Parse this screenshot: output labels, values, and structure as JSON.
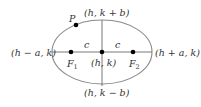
{
  "diagram": {
    "type": "ellipse-foci",
    "colors": {
      "ellipse_stroke": "#8a8a8a",
      "axis_stroke": "#6a6a6a",
      "point_fill": "#000000",
      "text": "#333333"
    },
    "labels": {
      "top_vertex": "(h, k + b)",
      "bottom_vertex": "(h, k − b)",
      "left_vertex": "(h − a, k)",
      "right_vertex": "(h + a, k)",
      "center": "(h, k)",
      "point_p": "P",
      "focus1_main": "F",
      "focus1_sub": "1",
      "focus2_main": "F",
      "focus2_sub": "2",
      "c_left": "c",
      "c_right": "c"
    }
  }
}
